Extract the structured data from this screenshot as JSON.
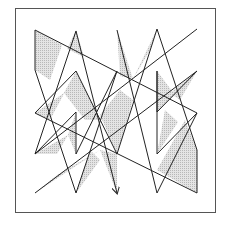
{
  "figure": {
    "type": "geometric-polyline-diagram",
    "frame": {
      "x": 15,
      "y": 8,
      "width": 201,
      "height": 205,
      "stroke": "#555555"
    },
    "style": {
      "stroke": "#222222",
      "stroke_width": 1,
      "fill": "#d6d6d6",
      "fill_rule": "evenodd",
      "background": "#ffffff"
    },
    "path_points": [
      [
        117,
        30
      ],
      [
        157,
        193
      ],
      [
        197,
        113
      ],
      [
        35,
        30
      ],
      [
        35,
        70
      ],
      [
        76,
        193
      ],
      [
        117,
        71
      ],
      [
        76,
        154
      ],
      [
        76,
        112
      ],
      [
        35,
        154
      ],
      [
        76,
        31
      ],
      [
        117,
        193
      ]
    ],
    "extra_segments": [
      [
        [
          197,
          29
        ],
        [
          35,
          154
        ]
      ],
      [
        [
          197,
          71
        ],
        [
          35,
          193
        ]
      ],
      [
        [
          35,
          113
        ],
        [
          197,
          193
        ]
      ],
      [
        [
          157,
          29
        ],
        [
          197,
          150
        ]
      ],
      [
        [
          197,
          150
        ],
        [
          197,
          193
        ]
      ],
      [
        [
          157,
          29
        ],
        [
          117,
          154
        ]
      ],
      [
        [
          76,
          71
        ],
        [
          117,
          154
        ]
      ],
      [
        [
          76,
          71
        ],
        [
          35,
          113
        ]
      ],
      [
        [
          157,
          71
        ],
        [
          157,
          112
        ]
      ],
      [
        [
          157,
          112
        ],
        [
          197,
          71
        ]
      ],
      [
        [
          157,
          154
        ],
        [
          197,
          113
        ]
      ],
      [
        [
          157,
          154
        ],
        [
          157,
          71
        ]
      ]
    ],
    "arrow_end": [
      117,
      193
    ]
  }
}
